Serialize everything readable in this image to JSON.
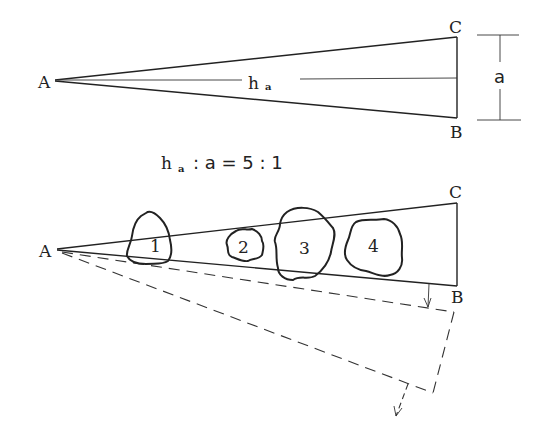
{
  "figure": {
    "top_triangle": {
      "vertices": {
        "A": "A",
        "B": "B",
        "C": "C"
      },
      "height_label": {
        "main": "h",
        "sub": "a"
      },
      "side_label": "a"
    },
    "ratio": {
      "h": "h",
      "sub": "a",
      "rest": ": a = 5 : 1"
    },
    "bottom_triangle": {
      "vertices": {
        "A": "A",
        "B": "B",
        "C": "C"
      },
      "objects": [
        {
          "label": "1"
        },
        {
          "label": "2"
        },
        {
          "label": "3"
        },
        {
          "label": "4"
        }
      ]
    }
  }
}
